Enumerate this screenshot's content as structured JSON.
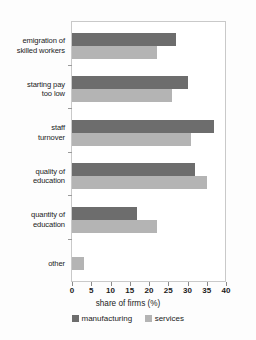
{
  "chart_data": {
    "type": "bar",
    "orientation": "horizontal",
    "title": "",
    "xlabel": "share of firms (%)",
    "ylabel": "",
    "xlim": [
      0,
      40
    ],
    "xticks": [
      0,
      5,
      10,
      15,
      20,
      25,
      30,
      35,
      40
    ],
    "xtick_labels": [
      "0",
      "5",
      "10",
      "15",
      "20",
      "25",
      "30",
      "35",
      "40"
    ],
    "grid": false,
    "legend_position": "bottom",
    "categories": [
      "emigration of skilled workers",
      "starting pay too low",
      "staff turnover",
      "quality of education",
      "quantity of education",
      "other"
    ],
    "category_lines": [
      [
        "emigration of",
        "skilled workers"
      ],
      [
        "starting pay",
        "too low"
      ],
      [
        "staff",
        "turnover"
      ],
      [
        "quality of",
        "education"
      ],
      [
        "quantity of",
        "education"
      ],
      [
        "other"
      ]
    ],
    "series": [
      {
        "name": "manufacturing",
        "color": "#6d6d6d",
        "values": [
          27,
          30,
          37,
          32,
          17,
          0
        ]
      },
      {
        "name": "services",
        "color": "#b4b4b4",
        "values": [
          22,
          26,
          31,
          35,
          22,
          3
        ]
      }
    ]
  },
  "legend": {
    "items": [
      {
        "label": "manufacturing",
        "swatch": "manufacturing"
      },
      {
        "label": "services",
        "swatch": "services"
      }
    ]
  },
  "axis": {
    "x_title": "share of firms (%)"
  },
  "colors": {
    "manufacturing": "#6d6d6d",
    "services": "#b4b4b4",
    "axis": "#8a8a8a",
    "text": "#1b1b1b",
    "background": "#fdfdfd"
  }
}
